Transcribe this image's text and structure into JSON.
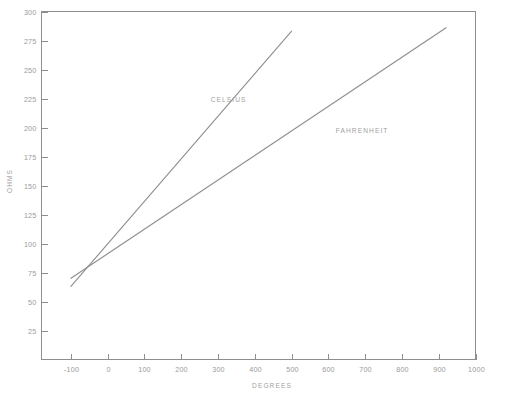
{
  "chart_data": {
    "type": "line",
    "title": "",
    "subtitle": "",
    "xlabel": "DEGREES",
    "ylabel": "OHMS",
    "xlim": [
      -180,
      1000
    ],
    "ylim": [
      0,
      300
    ],
    "xticks": [
      -100,
      0,
      100,
      200,
      300,
      400,
      500,
      600,
      700,
      800,
      900,
      1000
    ],
    "xtick_labels": [
      "-100",
      "0",
      "100",
      "200",
      "300",
      "400",
      "500",
      "600",
      "700",
      "800",
      "900",
      "1000"
    ],
    "yticks": [
      25,
      50,
      75,
      100,
      125,
      150,
      175,
      200,
      225,
      250,
      275,
      300
    ],
    "ytick_labels": [
      "25",
      "50",
      "75",
      "100",
      "125",
      "150",
      "175",
      "200",
      "225",
      "250",
      "275",
      "300"
    ],
    "grid": false,
    "legend_position": "inline-annotation",
    "line_color": "#8e8e8e",
    "text_color": "#9a9a9a",
    "background": "#ffffff",
    "series": [
      {
        "name": "CELSIUS",
        "label": "CELSIUS",
        "color": "#8e8e8e",
        "x": [
          -100,
          500
        ],
        "values": [
          63,
          283
        ],
        "label_x": 280,
        "label_y": 222,
        "annotation": "CELSIUS"
      },
      {
        "name": "FAHRENHEIT",
        "label": "FAHRENHEIT",
        "color": "#8e8e8e",
        "x": [
          -100,
          920
        ],
        "values": [
          70,
          286
        ],
        "label_x": 620,
        "label_y": 195,
        "annotation": "FAHRENHEIT"
      }
    ],
    "intersection": {
      "x": -50,
      "y": 80
    }
  }
}
